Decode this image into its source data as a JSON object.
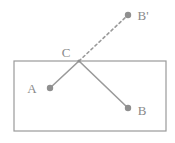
{
  "diagram": {
    "colors": {
      "stroke": "#9a9a9a",
      "point_fill": "#8f8f8f",
      "label_fill": "#8a8a8a",
      "dashed_stroke": "#9a9a9a",
      "background": "#ffffff"
    },
    "boundary": {
      "name": "rectangle",
      "x": 14,
      "y": 61,
      "width": 152,
      "height": 70,
      "stroke_width": 1.2
    },
    "points": [
      {
        "id": "A",
        "label": "A",
        "cx": 50,
        "cy": 88,
        "r": 3.2,
        "label_x": 32,
        "label_y": 93
      },
      {
        "id": "B",
        "label": "B",
        "cx": 128,
        "cy": 108,
        "r": 3.2,
        "label_x": 139,
        "label_y": 115
      },
      {
        "id": "C",
        "label": "C",
        "cx": 79,
        "cy": 61,
        "r": 1.6,
        "label_x": 63,
        "label_y": 57
      },
      {
        "id": "Bp",
        "label": "B'",
        "cx": 128,
        "cy": 15,
        "r": 3.2,
        "label_x": 138,
        "label_y": 20
      }
    ],
    "segments": [
      {
        "id": "CA",
        "from": "C",
        "to": "A",
        "x1": 79,
        "y1": 61,
        "x2": 50,
        "y2": 88,
        "style": "solid",
        "stroke_width": 1.6
      },
      {
        "id": "CB",
        "from": "C",
        "to": "B",
        "x1": 79,
        "y1": 61,
        "x2": 128,
        "y2": 108,
        "style": "solid",
        "stroke_width": 1.6
      },
      {
        "id": "CBp",
        "from": "C",
        "to": "Bp",
        "x1": 79,
        "y1": 61,
        "x2": 128,
        "y2": 15,
        "style": "dashed",
        "stroke_width": 1.6,
        "dash_pattern": "2.5 3"
      }
    ]
  }
}
